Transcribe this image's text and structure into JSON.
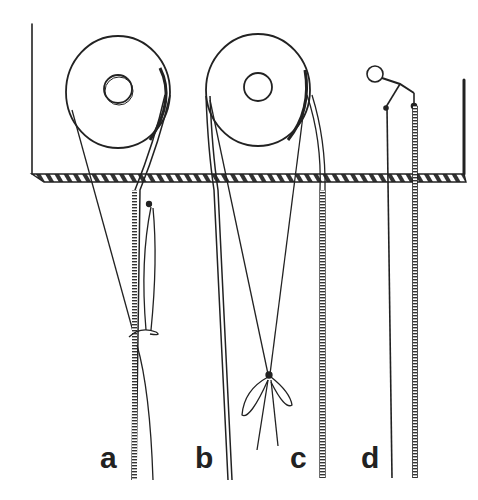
{
  "figure": {
    "panels": [
      {
        "id": "a",
        "label": "a",
        "description": "Reel with tape and string tied in a loop knot around the tape"
      },
      {
        "id": "b",
        "label": "b",
        "description": "Reel with tape hanging down on the left side"
      },
      {
        "id": "c",
        "label": "c",
        "description": "Two strings crossed and tied in a bow, tape on right"
      },
      {
        "id": "d",
        "label": "d",
        "description": "Small ring-and-lever clip holding a string and a tape"
      }
    ],
    "colors": {
      "ink": "#222222",
      "background": "#ffffff"
    }
  }
}
